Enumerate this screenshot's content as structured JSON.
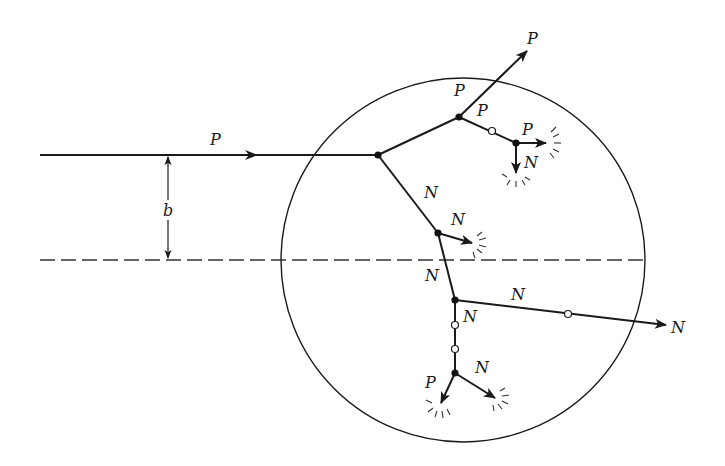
{
  "figure": {
    "colors": {
      "ink": "#1a1a1a",
      "background": "#ffffff"
    },
    "nucleus": {
      "cx": 463,
      "cy": 260,
      "r": 182
    },
    "impact_parameter_label": "b",
    "incident_label": "P",
    "labels": {
      "incident": "P",
      "b": "b",
      "proton_escape_outer": "P",
      "proton_escape_inner": "P",
      "branch_p_mid": "P",
      "c_out_p": "P",
      "c_out_n": "N",
      "a_to_d": "N",
      "d_out_n": "N",
      "d_to_e": "N",
      "e_to_right": "N",
      "neutron_escape": "N",
      "e_to_down": "N",
      "f_out_p": "P",
      "f_out_n": "N"
    },
    "vertices": [
      {
        "id": "A",
        "x": 378,
        "y": 155,
        "type": "collision"
      },
      {
        "id": "B",
        "x": 459,
        "y": 117,
        "type": "collision"
      },
      {
        "id": "C",
        "x": 516,
        "y": 143,
        "type": "collision"
      },
      {
        "id": "D",
        "x": 438,
        "y": 233,
        "type": "collision"
      },
      {
        "id": "E",
        "x": 455,
        "y": 300,
        "type": "collision"
      },
      {
        "id": "F",
        "x": 455,
        "y": 373,
        "type": "collision"
      }
    ],
    "open_points": [
      {
        "x": 492,
        "y": 131
      },
      {
        "x": 568,
        "y": 314
      },
      {
        "x": 455,
        "y": 325
      },
      {
        "x": 455,
        "y": 349
      }
    ],
    "legend_note": "filled dots = collisions; open circles = Pauli-blocked collisions; starbursts = particle absorbed"
  }
}
